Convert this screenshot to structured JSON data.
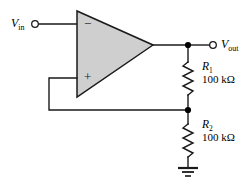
{
  "figure": {
    "type": "schematic"
  },
  "terminals": {
    "input": {
      "label_main": "V",
      "label_sub": "in",
      "name": "v-in-terminal"
    },
    "output": {
      "label_main": "V",
      "label_sub": "out",
      "name": "v-out-terminal"
    }
  },
  "opamp": {
    "name": "operational-amplifier",
    "inverting_sign": "−",
    "noninverting_sign": "+",
    "fill_color": "#cfcfcf",
    "outline_color": "#1a1a1a"
  },
  "resistors": [
    {
      "name": "R",
      "subscript": "1",
      "value": "100 kΩ"
    },
    {
      "name": "R",
      "subscript": "2",
      "value": "100 kΩ"
    }
  ],
  "ground": {
    "name": "ground-symbol",
    "bars": 3
  },
  "colors": {
    "wire": "#1a1a1a",
    "amp_fill": "#cfcfcf",
    "background": "#ffffff",
    "node": "#000000"
  }
}
